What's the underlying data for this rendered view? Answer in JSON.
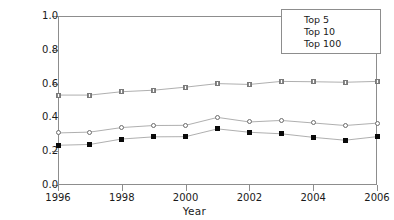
{
  "chart_data": {
    "type": "line",
    "title": "",
    "xlabel": "Year",
    "ylabel": "on centration Ratio",
    "x": [
      1996,
      1997,
      1998,
      1999,
      2000,
      2001,
      2002,
      2003,
      2004,
      2005,
      2006
    ],
    "xlim": [
      1996,
      2006
    ],
    "ylim": [
      0.0,
      1.0
    ],
    "x_ticks": [
      "1996",
      "1998",
      "2000",
      "2002",
      "2004",
      "2006"
    ],
    "x_tick_values": [
      1996,
      1998,
      2000,
      2002,
      2004,
      2006
    ],
    "y_ticks": [
      "0.0",
      "0.2",
      "0.4",
      "0.6",
      "0.8",
      "1.0"
    ],
    "y_tick_values": [
      0.0,
      0.2,
      0.4,
      0.6,
      0.8,
      1.0
    ],
    "grid": false,
    "legend_position": "top-right",
    "series": [
      {
        "name": "Top 5",
        "marker": "filled-square",
        "color": "#0a0a0a",
        "values": [
          0.235,
          0.24,
          0.272,
          0.285,
          0.286,
          0.332,
          0.312,
          0.303,
          0.282,
          0.265,
          0.286
        ]
      },
      {
        "name": "Top 10",
        "marker": "open-circle",
        "color": "#6d6d6d",
        "values": [
          0.308,
          0.313,
          0.34,
          0.352,
          0.353,
          0.4,
          0.373,
          0.382,
          0.367,
          0.352,
          0.366
        ]
      },
      {
        "name": "Top 100",
        "marker": "hatched-square",
        "color": "#7a7a7a",
        "values": [
          0.532,
          0.532,
          0.552,
          0.561,
          0.579,
          0.6,
          0.595,
          0.613,
          0.611,
          0.608,
          0.613
        ]
      }
    ]
  },
  "axes": {
    "y_title": "on centration Ratio",
    "x_title": "Year"
  },
  "legend": {
    "entries": [
      {
        "label": "Top 5",
        "marker": "filled-square"
      },
      {
        "label": "Top 10",
        "marker": "open-circle"
      },
      {
        "label": "Top 100",
        "marker": "hatched-square"
      }
    ]
  },
  "colors": {
    "frame": "#8d8d8d",
    "text": "#1a1a1a",
    "background": "#ffffff",
    "top5": "#0a0a0a",
    "top10": "#6d6d6d",
    "top100": "#7a7a7a"
  }
}
